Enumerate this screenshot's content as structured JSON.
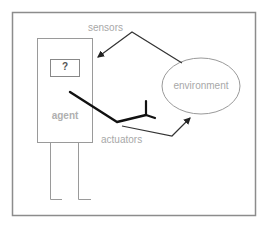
{
  "diagram": {
    "labels": {
      "sensors": "sensors",
      "actuators": "actuators",
      "environment": "environment",
      "agent": "agent",
      "unknown": "?"
    },
    "nodes": [
      {
        "id": "agent",
        "label": "agent",
        "shape": "rectangle"
      },
      {
        "id": "agent-program",
        "label": "?",
        "shape": "rectangle",
        "parent": "agent"
      },
      {
        "id": "environment",
        "label": "environment",
        "shape": "ellipse"
      }
    ],
    "edges": [
      {
        "from": "environment",
        "to": "agent",
        "label": "sensors"
      },
      {
        "from": "agent",
        "to": "environment",
        "label": "actuators"
      }
    ],
    "colors": {
      "frame": "#8c8c8c",
      "agent_outline": "#9a9a9a",
      "arm": "#111111",
      "arrow": "#333333",
      "label_text": "#a8a8a8"
    }
  }
}
